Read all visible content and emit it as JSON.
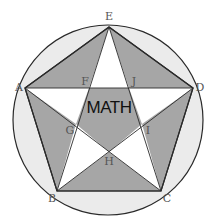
{
  "diagram": {
    "center_label": "MATH",
    "colors": {
      "circle_fill": "#ebebeb",
      "shaded": "#a6a6a6",
      "star_points": "#ffffff",
      "stroke": "#2a2a2a"
    },
    "circle": {
      "cx": 108,
      "cy": 120,
      "r": 95
    },
    "vertices": {
      "A": {
        "label": "A",
        "x": 25,
        "y": 88
      },
      "B": {
        "label": "B",
        "x": 57,
        "y": 191
      },
      "C": {
        "label": "C",
        "x": 161,
        "y": 191
      },
      "D": {
        "label": "D",
        "x": 193,
        "y": 88
      },
      "E": {
        "label": "E",
        "x": 109,
        "y": 27
      },
      "F": {
        "label": "F",
        "x": 89,
        "y": 88
      },
      "G": {
        "label": "G",
        "x": 76,
        "y": 124
      },
      "H": {
        "label": "H",
        "x": 109,
        "y": 152
      },
      "I": {
        "label": "I",
        "x": 142,
        "y": 124
      },
      "J": {
        "label": "J",
        "x": 129,
        "y": 88
      }
    },
    "labels": {
      "A": "A",
      "B": "B",
      "C": "C",
      "D": "D",
      "E": "E",
      "F": "F",
      "G": "G",
      "H": "H",
      "I": "I",
      "J": "J"
    }
  }
}
